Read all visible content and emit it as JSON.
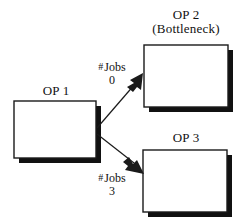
{
  "diagram": {
    "type": "flow-diagram",
    "background_color": "#ffffff",
    "line_color": "#1a1a1a",
    "box_fill_color": "#ffffff",
    "shadow_color": "#111111",
    "nodes": [
      {
        "id": "op1",
        "label": "OP 1",
        "sublabel": "",
        "box": {
          "x": 14,
          "y": 101,
          "width": 82,
          "height": 57
        }
      },
      {
        "id": "op2",
        "label": "OP 2",
        "sublabel": "(Bottleneck)",
        "box": {
          "x": 144,
          "y": 45,
          "width": 84,
          "height": 62
        }
      },
      {
        "id": "op3",
        "label": "OP 3",
        "sublabel": "",
        "box": {
          "x": 143,
          "y": 150,
          "width": 84,
          "height": 62
        }
      }
    ],
    "edges": [
      {
        "id": "op1-to-op2",
        "from": "op1",
        "to": "op2",
        "label": "# Jobs",
        "hash_symbol": "#",
        "label_text": "Jobs",
        "count": "0",
        "arrow": "up-right"
      },
      {
        "id": "op1-to-op3",
        "from": "op1",
        "to": "op3",
        "label": "# Jobs",
        "hash_symbol": "#",
        "label_text": "Jobs",
        "count": "3",
        "arrow": "down-right"
      }
    ]
  }
}
